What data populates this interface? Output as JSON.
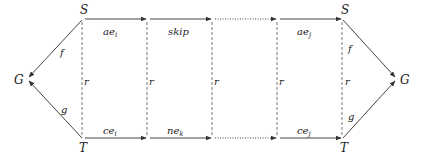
{
  "diagram": {
    "nodes": {
      "left_g": "G",
      "left_s": "S",
      "left_t": "T",
      "right_s": "S",
      "right_t": "T",
      "right_g": "G"
    },
    "left_edges": {
      "f": "f",
      "g": "g"
    },
    "right_edges": {
      "f": "f",
      "g": "g"
    },
    "vertical_label": "r",
    "verticals": [
      "r",
      "r",
      "r",
      "r",
      "r"
    ],
    "top_edges": [
      {
        "base": "ae",
        "sub": "i",
        "style": "solid"
      },
      {
        "base": "skip",
        "sub": "",
        "style": "solid"
      },
      {
        "base": "",
        "sub": "",
        "style": "dotted"
      },
      {
        "base": "ae",
        "sub": "j",
        "style": "solid"
      }
    ],
    "bottom_edges": [
      {
        "base": "ce",
        "sub": "i",
        "style": "solid"
      },
      {
        "base": "ne",
        "sub": "k",
        "style": "solid"
      },
      {
        "base": "",
        "sub": "",
        "style": "dotted"
      },
      {
        "base": "ce",
        "sub": "j",
        "style": "solid"
      }
    ],
    "colors": {
      "line": "#444444",
      "text": "#222222",
      "background": "#ffffff"
    }
  }
}
